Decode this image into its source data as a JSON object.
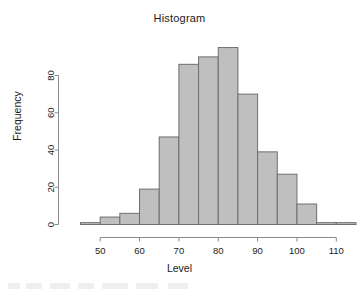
{
  "chart_data": {
    "type": "bar",
    "title": "Histogram",
    "xlabel": "Level",
    "ylabel": "Frequency",
    "grid": false,
    "legend": "none",
    "xlim": [
      45,
      115
    ],
    "ylim": [
      0,
      95
    ],
    "bin_width": 5,
    "xticks": [
      50,
      60,
      70,
      80,
      90,
      100,
      110
    ],
    "yticks": [
      0,
      20,
      40,
      60,
      80
    ],
    "bin_starts": [
      45,
      50,
      55,
      60,
      65,
      70,
      75,
      80,
      85,
      90,
      95,
      100,
      105,
      110
    ],
    "bin_ends": [
      50,
      55,
      60,
      65,
      70,
      75,
      80,
      85,
      90,
      95,
      100,
      105,
      110,
      115
    ],
    "categories": [
      "45-50",
      "50-55",
      "55-60",
      "60-65",
      "65-70",
      "70-75",
      "75-80",
      "80-85",
      "85-90",
      "90-95",
      "95-100",
      "100-105",
      "105-110",
      "110-115"
    ],
    "values": [
      1,
      4,
      6,
      19,
      47,
      86,
      90,
      95,
      70,
      39,
      27,
      11,
      1,
      1
    ],
    "colors": {
      "bar_fill": "#bfbfbf",
      "bar_stroke": "#6e6e6e",
      "axis": "#8a8a8a",
      "text": "#1a1a1a",
      "background": "#ffffff"
    }
  }
}
